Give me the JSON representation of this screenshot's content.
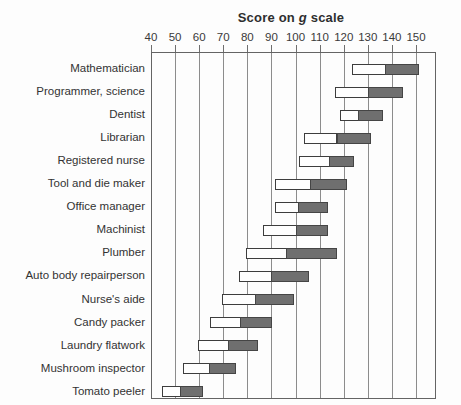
{
  "title": {
    "full": "Score on g scale",
    "pre": "Score on ",
    "emphasis": "g",
    "post": " scale"
  },
  "chart_data": {
    "type": "bar",
    "subtype": "horizontal-range-bars",
    "title": "Score on g scale",
    "x_axis": {
      "position": "top",
      "min": 40,
      "max": 150,
      "ticks": [
        40,
        50,
        60,
        70,
        80,
        90,
        100,
        110,
        120,
        130,
        140,
        150
      ]
    },
    "grid": "vertical-lines-at-each-tick",
    "legend": "none",
    "segment_colors": {
      "lower_segment": "#ffffff",
      "upper_segment": "#6f6f6f"
    },
    "bars": [
      {
        "occupation": "Mathematician",
        "start": 123,
        "split": 137,
        "end": 151
      },
      {
        "occupation": "Programmer, science",
        "start": 116,
        "split": 130,
        "end": 144
      },
      {
        "occupation": "Dentist",
        "start": 118,
        "split": 126,
        "end": 136
      },
      {
        "occupation": "Librarian",
        "start": 103,
        "split": 117,
        "end": 131
      },
      {
        "occupation": "Registered nurse",
        "start": 101,
        "split": 114,
        "end": 124
      },
      {
        "occupation": "Tool and die maker",
        "start": 91,
        "split": 106,
        "end": 121
      },
      {
        "occupation": "Office manager",
        "start": 91,
        "split": 101,
        "end": 113
      },
      {
        "occupation": "Machinist",
        "start": 86,
        "split": 100,
        "end": 113
      },
      {
        "occupation": "Plumber",
        "start": 79,
        "split": 96,
        "end": 117
      },
      {
        "occupation": "Auto body repairperson",
        "start": 76,
        "split": 90,
        "end": 105
      },
      {
        "occupation": "Nurse's aide",
        "start": 69,
        "split": 83,
        "end": 99
      },
      {
        "occupation": "Candy packer",
        "start": 64,
        "split": 77,
        "end": 90
      },
      {
        "occupation": "Laundry flatwork",
        "start": 59,
        "split": 72,
        "end": 84
      },
      {
        "occupation": "Mushroom inspector",
        "start": 53,
        "split": 64,
        "end": 75
      },
      {
        "occupation": "Tomato peeler",
        "start": 44,
        "split": 52,
        "end": 61
      }
    ]
  },
  "colors": {
    "background": "#fdfdfd",
    "text": "#2e2e2e",
    "frame": "#646464",
    "gridline": "#8c8c8c",
    "bar_border": "#3d3d3d",
    "upper_fill": "#6f6f6f",
    "lower_fill": "#ffffff"
  }
}
